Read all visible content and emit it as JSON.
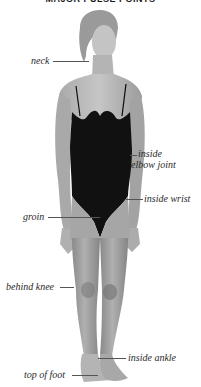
{
  "title": "MAJOR PULSE POINTS",
  "colors": {
    "background": "#ffffff",
    "skin": "#b9b9b9",
    "skin_shadow": "#8e8e8e",
    "hair": "#9a9a9a",
    "swimsuit": "#111111",
    "label_text": "#2a2a2a",
    "leader_line": "#555555"
  },
  "figure": {
    "icon": "human-figure-icon"
  },
  "labels": [
    {
      "id": "neck",
      "text": "neck",
      "side": "left"
    },
    {
      "id": "inside-elbow-joint",
      "line1": "inside",
      "line2": "elbow joint",
      "side": "right"
    },
    {
      "id": "inside-wrist",
      "text": "inside wrist",
      "side": "right"
    },
    {
      "id": "groin",
      "text": "groin",
      "side": "left"
    },
    {
      "id": "behind-knee",
      "text": "behind knee",
      "side": "left"
    },
    {
      "id": "inside-ankle",
      "text": "inside ankle",
      "side": "right"
    },
    {
      "id": "top-of-foot",
      "text": "top of foot",
      "side": "left"
    }
  ]
}
